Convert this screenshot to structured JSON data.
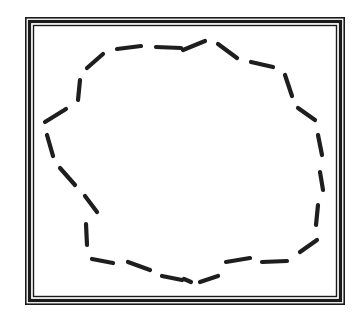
{
  "figure": {
    "colors": {
      "background": "#ffffff",
      "frame": "#1a1a1a",
      "frame_inner_gap": "#ffffff",
      "stroke": "#1e1e1e"
    },
    "frame": {
      "outer": {
        "x": 25,
        "y": 17,
        "w": 320,
        "h": 288
      },
      "lines": 3
    },
    "dashes": [
      [
        87,
        68,
        103,
        54
      ],
      [
        117,
        49,
        141,
        46
      ],
      [
        156,
        47,
        181,
        48
      ],
      [
        183,
        50,
        205,
        41
      ],
      [
        218,
        44,
        237,
        58
      ],
      [
        251,
        62,
        273,
        67
      ],
      [
        285,
        75,
        292,
        96
      ],
      [
        298,
        108,
        315,
        120
      ],
      [
        318,
        135,
        322,
        155
      ],
      [
        320,
        172,
        323,
        190
      ],
      [
        318,
        205,
        316,
        225
      ],
      [
        317,
        240,
        300,
        252
      ],
      [
        287,
        261,
        262,
        262
      ],
      [
        250,
        258,
        226,
        262
      ],
      [
        218,
        276,
        200,
        282
      ],
      [
        191,
        282,
        184,
        279
      ],
      [
        182,
        280,
        162,
        276
      ],
      [
        150,
        270,
        128,
        262
      ],
      [
        113,
        263,
        92,
        259
      ],
      [
        87,
        245,
        86,
        224
      ],
      [
        97,
        212,
        85,
        196
      ],
      [
        75,
        185,
        60,
        168
      ],
      [
        53,
        156,
        47,
        135
      ],
      [
        45,
        122,
        66,
        109
      ],
      [
        78,
        100,
        80,
        80
      ]
    ]
  }
}
